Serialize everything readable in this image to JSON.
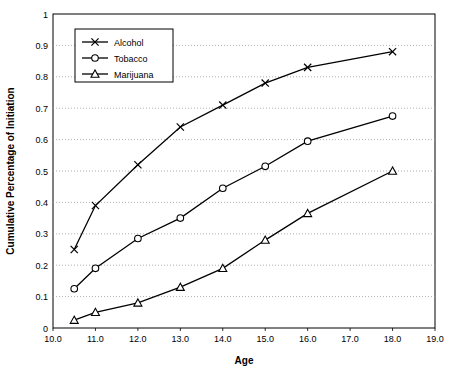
{
  "chart_data": {
    "type": "line",
    "title": "",
    "xlabel": "Age",
    "ylabel": "Cumulative Percentage of Initiation",
    "xlim": [
      10.0,
      19.0
    ],
    "ylim": [
      0,
      1
    ],
    "xticks": [
      "10.0",
      "11.0",
      "12.0",
      "13.0",
      "14.0",
      "15.0",
      "16.0",
      "17.0",
      "18.0",
      "19.0"
    ],
    "yticks": [
      "0",
      "0.1",
      "0.2",
      "0.3",
      "0.4",
      "0.5",
      "0.6",
      "0.7",
      "0.8",
      "0.9",
      "1"
    ],
    "grid": "horizontal",
    "legend_position": "top-left",
    "x": [
      10.5,
      11.0,
      12.0,
      13.0,
      14.0,
      15.0,
      16.0,
      18.0
    ],
    "series": [
      {
        "name": "Alcohol",
        "marker": "x",
        "values": [
          0.25,
          0.39,
          0.52,
          0.64,
          0.71,
          0.78,
          0.83,
          0.88
        ]
      },
      {
        "name": "Tobacco",
        "marker": "o",
        "values": [
          0.125,
          0.19,
          0.285,
          0.35,
          0.445,
          0.515,
          0.595,
          0.675
        ]
      },
      {
        "name": "Marijuana",
        "marker": "triangle",
        "values": [
          0.025,
          0.05,
          0.08,
          0.13,
          0.19,
          0.28,
          0.365,
          0.5
        ]
      }
    ],
    "colors": {
      "line": "#000000",
      "grid": "#9a9a9a",
      "axis": "#000000",
      "background": "#ffffff"
    }
  }
}
